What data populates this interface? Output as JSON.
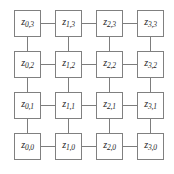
{
  "figure": {
    "name": "4x4-lattice-graph",
    "background_color": "#ffffff",
    "node_border_color": "#808080",
    "node_fill_color": "#ffffff",
    "edge_color": "#7d7d7d",
    "label_color": "#242424",
    "columns": 4,
    "rows": 4,
    "variable_symbol": "z"
  },
  "chart_data": {
    "type": "diagram",
    "title": "",
    "layout": "grid-lattice",
    "grid": {
      "columns": 4,
      "rows": 4,
      "origin_x": 14,
      "origin_y": 10,
      "pitch_x": 41,
      "pitch_y": 41,
      "node_size": 27
    },
    "nodes": [
      {
        "id": "z-0-3",
        "symbol": "z",
        "sub": "0,3",
        "col": 0,
        "row_label": 3,
        "x": 14,
        "y": 10
      },
      {
        "id": "z-1-3",
        "symbol": "z",
        "sub": "1,3",
        "col": 1,
        "row_label": 3,
        "x": 55,
        "y": 10
      },
      {
        "id": "z-2-3",
        "symbol": "z",
        "sub": "2,3",
        "col": 2,
        "row_label": 3,
        "x": 96,
        "y": 10
      },
      {
        "id": "z-3-3",
        "symbol": "z",
        "sub": "3,3",
        "col": 3,
        "row_label": 3,
        "x": 137,
        "y": 10
      },
      {
        "id": "z-0-2",
        "symbol": "z",
        "sub": "0,2",
        "col": 0,
        "row_label": 2,
        "x": 14,
        "y": 51
      },
      {
        "id": "z-1-2",
        "symbol": "z",
        "sub": "1,2",
        "col": 1,
        "row_label": 2,
        "x": 55,
        "y": 51
      },
      {
        "id": "z-2-2",
        "symbol": "z",
        "sub": "2,2",
        "col": 2,
        "row_label": 2,
        "x": 96,
        "y": 51
      },
      {
        "id": "z-3-2",
        "symbol": "z",
        "sub": "3,2",
        "col": 3,
        "row_label": 2,
        "x": 137,
        "y": 51
      },
      {
        "id": "z-0-1",
        "symbol": "z",
        "sub": "0,1",
        "col": 0,
        "row_label": 1,
        "x": 14,
        "y": 92
      },
      {
        "id": "z-1-1",
        "symbol": "z",
        "sub": "1,1",
        "col": 1,
        "row_label": 1,
        "x": 55,
        "y": 92
      },
      {
        "id": "z-2-1",
        "symbol": "z",
        "sub": "2,1",
        "col": 2,
        "row_label": 1,
        "x": 96,
        "y": 92
      },
      {
        "id": "z-3-1",
        "symbol": "z",
        "sub": "3,1",
        "col": 3,
        "row_label": 1,
        "x": 137,
        "y": 92
      },
      {
        "id": "z-0-0",
        "symbol": "z",
        "sub": "0,0",
        "col": 0,
        "row_label": 0,
        "x": 14,
        "y": 133
      },
      {
        "id": "z-1-0",
        "symbol": "z",
        "sub": "1,0",
        "col": 1,
        "row_label": 0,
        "x": 55,
        "y": 133
      },
      {
        "id": "z-2-0",
        "symbol": "z",
        "sub": "2,0",
        "col": 2,
        "row_label": 0,
        "x": 96,
        "y": 133
      },
      {
        "id": "z-3-0",
        "symbol": "z",
        "sub": "3,0",
        "col": 3,
        "row_label": 0,
        "x": 137,
        "y": 133
      }
    ],
    "edges": [
      {
        "from": "z-0-3",
        "to": "z-1-3",
        "orientation": "horizontal"
      },
      {
        "from": "z-1-3",
        "to": "z-2-3",
        "orientation": "horizontal"
      },
      {
        "from": "z-2-3",
        "to": "z-3-3",
        "orientation": "horizontal"
      },
      {
        "from": "z-0-2",
        "to": "z-1-2",
        "orientation": "horizontal"
      },
      {
        "from": "z-1-2",
        "to": "z-2-2",
        "orientation": "horizontal"
      },
      {
        "from": "z-2-2",
        "to": "z-3-2",
        "orientation": "horizontal"
      },
      {
        "from": "z-0-1",
        "to": "z-1-1",
        "orientation": "horizontal"
      },
      {
        "from": "z-1-1",
        "to": "z-2-1",
        "orientation": "horizontal"
      },
      {
        "from": "z-2-1",
        "to": "z-3-1",
        "orientation": "horizontal"
      },
      {
        "from": "z-0-0",
        "to": "z-1-0",
        "orientation": "horizontal"
      },
      {
        "from": "z-1-0",
        "to": "z-2-0",
        "orientation": "horizontal"
      },
      {
        "from": "z-2-0",
        "to": "z-3-0",
        "orientation": "horizontal"
      },
      {
        "from": "z-0-3",
        "to": "z-0-2",
        "orientation": "vertical"
      },
      {
        "from": "z-0-2",
        "to": "z-0-1",
        "orientation": "vertical"
      },
      {
        "from": "z-0-1",
        "to": "z-0-0",
        "orientation": "vertical"
      },
      {
        "from": "z-1-3",
        "to": "z-1-2",
        "orientation": "vertical"
      },
      {
        "from": "z-1-2",
        "to": "z-1-1",
        "orientation": "vertical"
      },
      {
        "from": "z-1-1",
        "to": "z-1-0",
        "orientation": "vertical"
      },
      {
        "from": "z-2-3",
        "to": "z-2-2",
        "orientation": "vertical"
      },
      {
        "from": "z-2-2",
        "to": "z-2-1",
        "orientation": "vertical"
      },
      {
        "from": "z-2-1",
        "to": "z-2-0",
        "orientation": "vertical"
      },
      {
        "from": "z-3-3",
        "to": "z-3-2",
        "orientation": "vertical"
      },
      {
        "from": "z-3-2",
        "to": "z-3-1",
        "orientation": "vertical"
      },
      {
        "from": "z-3-1",
        "to": "z-3-0",
        "orientation": "vertical"
      }
    ]
  }
}
